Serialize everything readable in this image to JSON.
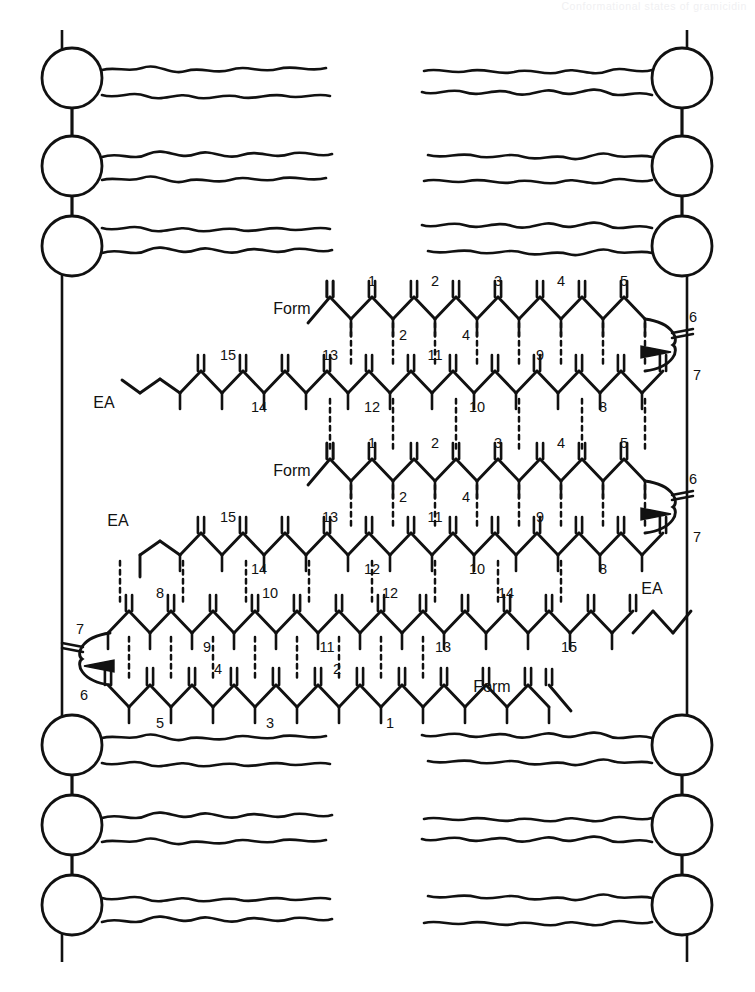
{
  "running_head": "Conformational states of gramicidin",
  "figure": {
    "name": "gramicidin-in-lipid-bilayer-diagram",
    "stroke_color": "#111111",
    "background_color": "#ffffff"
  },
  "membrane": {
    "name": "lipid-bilayer",
    "leaflets": [
      {
        "id": "top-left",
        "side": "left",
        "position": "top",
        "headgroup_count": 3,
        "tails_per_head": 2
      },
      {
        "id": "top-right",
        "side": "right",
        "position": "top",
        "headgroup_count": 3,
        "tails_per_head": 2
      },
      {
        "id": "bottom-left",
        "side": "left",
        "position": "bottom",
        "headgroup_count": 3,
        "tails_per_head": 2
      },
      {
        "id": "bottom-right",
        "side": "right",
        "position": "bottom",
        "headgroup_count": 3,
        "tails_per_head": 2
      }
    ],
    "border_lines": [
      "left-vertical",
      "right-vertical"
    ]
  },
  "peptide_chains": [
    {
      "id": "chain-1",
      "direction": "N-terminus-left",
      "n_terminus_label": "Form",
      "c_terminus_label": null,
      "residue_numbers": [
        1,
        2,
        3,
        4,
        5,
        6,
        7
      ],
      "turn_residues": [
        6,
        7
      ],
      "has_wedge_bond": true
    },
    {
      "id": "chain-2",
      "direction": "N-terminus-right",
      "n_terminus_label": null,
      "c_terminus_label": "EA",
      "residue_numbers": [
        8,
        9,
        10,
        11,
        12,
        13,
        14,
        15
      ],
      "turn_residues": [],
      "has_wedge_bond": false
    },
    {
      "id": "chain-3",
      "direction": "N-terminus-left",
      "n_terminus_label": "Form",
      "c_terminus_label": null,
      "residue_numbers": [
        1,
        2,
        3,
        4,
        5,
        6,
        7
      ],
      "turn_residues": [
        6,
        7
      ],
      "has_wedge_bond": true
    },
    {
      "id": "chain-4",
      "direction": "N-terminus-right",
      "n_terminus_label": null,
      "c_terminus_label": "EA",
      "residue_numbers": [
        8,
        9,
        10,
        11,
        12,
        13,
        14,
        15
      ],
      "turn_residues": [],
      "has_wedge_bond": false
    },
    {
      "id": "chain-5",
      "direction": "N-terminus-right",
      "n_terminus_label": "Form",
      "c_terminus_label": "EA",
      "residue_numbers": [
        1,
        2,
        3,
        4,
        5,
        6,
        7,
        8,
        9,
        10,
        11,
        12,
        13,
        14,
        15
      ],
      "turn_residues": [
        6,
        7
      ],
      "has_wedge_bond": true
    }
  ],
  "labels": {
    "formyl": "Form",
    "ethanolamine": "EA",
    "chain1_numbers": [
      "1",
      "2",
      "3",
      "4",
      "5",
      "6",
      "7"
    ],
    "chain2_numbers": [
      "15",
      "14",
      "13",
      "12",
      "11",
      "10",
      "9",
      "8"
    ],
    "chain3_numbers": [
      "1",
      "2",
      "3",
      "4",
      "5",
      "6",
      "7"
    ],
    "chain4_numbers": [
      "15",
      "14",
      "13",
      "12",
      "11",
      "10",
      "9",
      "8"
    ],
    "chain5_lower_numbers": [
      "7",
      "8",
      "9",
      "10",
      "11",
      "12",
      "13",
      "14",
      "15"
    ],
    "chain5_upper_numbers": [
      "6",
      "5",
      "4",
      "3",
      "2",
      "1"
    ]
  },
  "bond_legend": {
    "solid_line": "covalent backbone bond",
    "double_line": "carbonyl C=O",
    "dashed_line": "hydrogen bond",
    "wedge": "stereochemistry (out of plane)"
  }
}
